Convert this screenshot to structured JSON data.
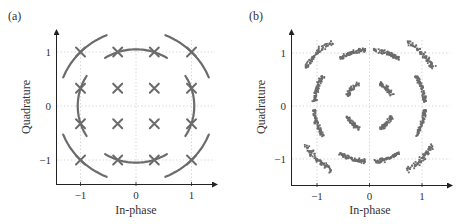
{
  "chart_data": [
    {
      "panel_label": "(a)",
      "type": "scatter",
      "title": "",
      "xlabel": "In-phase",
      "ylabel": "Quadrature",
      "xticks": [
        -1,
        0,
        1
      ],
      "yticks": [
        -1,
        0,
        1
      ],
      "xtick_labels": [
        "−1",
        "0",
        "1"
      ],
      "ytick_labels": [
        "−1",
        "0",
        "1"
      ],
      "xlim": [
        -1.4,
        1.45
      ],
      "ylim": [
        -1.45,
        1.4
      ],
      "grid": "dotted at ticks",
      "marker": "x",
      "points": [
        [
          -1,
          1
        ],
        [
          -0.33,
          1
        ],
        [
          0.33,
          1
        ],
        [
          1,
          1
        ],
        [
          -1,
          0.33
        ],
        [
          -0.33,
          0.33
        ],
        [
          0.33,
          0.33
        ],
        [
          1,
          0.33
        ],
        [
          -1,
          -0.33
        ],
        [
          -0.33,
          -0.33
        ],
        [
          0.33,
          -0.33
        ],
        [
          1,
          -0.33
        ],
        [
          -1,
          -1
        ],
        [
          -0.33,
          -1
        ],
        [
          0.33,
          -1
        ],
        [
          1,
          -1
        ]
      ],
      "arcs_description": "Circular arc traces through the outer 12 constellation points (phase rotation trajectories)"
    },
    {
      "panel_label": "(b)",
      "type": "scatter",
      "title": "",
      "xlabel": "In-phase",
      "ylabel": "Quadrature",
      "xticks": [
        -1,
        0,
        1
      ],
      "yticks": [
        -1,
        0,
        1
      ],
      "xtick_labels": [
        "−1",
        "0",
        "1"
      ],
      "ytick_labels": [
        "−1",
        "0",
        "1"
      ],
      "xlim": [
        -1.45,
        1.55
      ],
      "ylim": [
        -1.45,
        1.4
      ],
      "grid": "dotted at ticks",
      "marker": "dot",
      "description": "Noisy 16-QAM received symbols smeared along arcs around ideal constellation points"
    }
  ],
  "colors": {
    "data": "#6b6b6b",
    "axis": "#222222",
    "grid": "#cfcfcf"
  }
}
